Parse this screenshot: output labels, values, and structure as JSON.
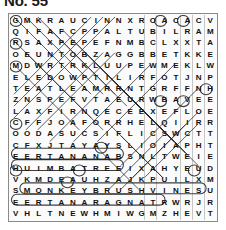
{
  "title": "No. 55",
  "puzzle": {
    "type": "word-search",
    "rows": 18,
    "cols": 18,
    "grid": [
      [
        "G",
        "M",
        "K",
        "R",
        "A",
        "U",
        "C",
        "I",
        "N",
        "N",
        "X",
        "R",
        "O",
        "A",
        "C",
        "A",
        "C",
        "V"
      ],
      [
        "Q",
        "I",
        "F",
        "A",
        "F",
        "C",
        "P",
        "P",
        "A",
        "L",
        "T",
        "U",
        "B",
        "I",
        "L",
        "R",
        "A",
        "M"
      ],
      [
        "R",
        "S",
        "A",
        "X",
        "P",
        "E",
        "P",
        "E",
        "F",
        "N",
        "M",
        "B",
        "C",
        "L",
        "X",
        "X",
        "T",
        "A"
      ],
      [
        "O",
        "E",
        "U",
        "N",
        "T",
        "O",
        "B",
        "Z",
        "A",
        "G",
        "G",
        "B",
        "B",
        "E",
        "T",
        "K",
        "K",
        "E"
      ],
      [
        "M",
        "D",
        "W",
        "R",
        "T",
        "R",
        "K",
        "L",
        "U",
        "U",
        "P",
        "E",
        "W",
        "M",
        "E",
        "K",
        "L",
        "W"
      ],
      [
        "E",
        "L",
        "E",
        "D",
        "O",
        "W",
        "P",
        "T",
        "I",
        "L",
        "I",
        "R",
        "F",
        "O",
        "T",
        "J",
        "N",
        "P"
      ],
      [
        "T",
        "E",
        "A",
        "T",
        "L",
        "E",
        "A",
        "M",
        "R",
        "R",
        "N",
        "T",
        "G",
        "R",
        "F",
        "F",
        "N",
        "H"
      ],
      [
        "Z",
        "N",
        "S",
        "P",
        "E",
        "F",
        "V",
        "T",
        "A",
        "E",
        "U",
        "R",
        "W",
        "B",
        "A",
        "V",
        "E",
        "E"
      ],
      [
        "L",
        "A",
        "X",
        "F",
        "I",
        "R",
        "N",
        "Q",
        "E",
        "C",
        "E",
        "E",
        "X",
        "E",
        "F",
        "L",
        "O",
        "E"
      ],
      [
        "C",
        "F",
        "F",
        "J",
        "O",
        "A",
        "F",
        "O",
        "R",
        "R",
        "H",
        "E",
        "L",
        "Q",
        "I",
        "I",
        "R",
        "R"
      ],
      [
        "O",
        "O",
        "D",
        "A",
        "S",
        "U",
        "C",
        "S",
        "I",
        "F",
        "L",
        "I",
        "C",
        "S",
        "W",
        "C",
        "T",
        "T"
      ],
      [
        "C",
        "F",
        "X",
        "J",
        "T",
        "A",
        "Y",
        "A",
        "Y",
        "S",
        "L",
        "I",
        "O",
        "I",
        "A",
        "P",
        "H",
        "T"
      ],
      [
        "E",
        "E",
        "R",
        "T",
        "A",
        "N",
        "A",
        "N",
        "A",
        "B",
        "S",
        "N",
        "L",
        "T",
        "W",
        "E",
        "I",
        "E"
      ],
      [
        "H",
        "U",
        "I",
        "M",
        "B",
        "A",
        "T",
        "R",
        "E",
        "E",
        "I",
        "X",
        "A",
        "H",
        "Y",
        "E",
        "U",
        "D"
      ],
      [
        "V",
        "K",
        "M",
        "D",
        "E",
        "A",
        "U",
        "H",
        "Z",
        "A",
        "J",
        "K",
        "P",
        "U",
        "I",
        "L",
        "X",
        "M"
      ],
      [
        "S",
        "M",
        "O",
        "N",
        "K",
        "E",
        "Y",
        "B",
        "R",
        "U",
        "S",
        "H",
        "V",
        "I",
        "N",
        "E",
        "S",
        "U"
      ],
      [
        "E",
        "E",
        "R",
        "T",
        "A",
        "N",
        "A",
        "R",
        "A",
        "G",
        "N",
        "A",
        "T",
        "R",
        "W",
        "R",
        "J",
        "R"
      ],
      [
        "V",
        "H",
        "L",
        "T",
        "N",
        "E",
        "W",
        "H",
        "M",
        "I",
        "W",
        "G",
        "M",
        "Z",
        "H",
        "E",
        "V",
        "T"
      ]
    ],
    "found_words_horizontal": [
      "EERTANANAB",
      "HUIMBATREE",
      "MONKEYBRUSHVINES",
      "EERTANARAGNAT"
    ]
  },
  "colors": {
    "page_background": "#ffffff",
    "grid_background": "#fbfbfb",
    "grid_border": "#8a8a8a",
    "letter": "#101010",
    "marking": "#1c1c1c"
  }
}
